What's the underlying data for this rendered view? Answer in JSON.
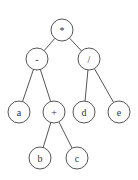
{
  "diagram": {
    "type": "expression-tree",
    "colors": {
      "stroke": "#555555",
      "label": "#333333",
      "background": "#ffffff"
    },
    "nodes": [
      {
        "id": "root",
        "label": "*",
        "x": 62,
        "y": 30,
        "r": 11
      },
      {
        "id": "minus",
        "label": "-",
        "x": 37,
        "y": 59,
        "r": 11
      },
      {
        "id": "div",
        "label": "/",
        "x": 89,
        "y": 59,
        "r": 11
      },
      {
        "id": "a",
        "label": "a",
        "x": 19,
        "y": 112,
        "r": 11
      },
      {
        "id": "plus",
        "label": "+",
        "x": 54,
        "y": 112,
        "r": 11
      },
      {
        "id": "d",
        "label": "d",
        "x": 84,
        "y": 112,
        "r": 11
      },
      {
        "id": "e",
        "label": "e",
        "x": 119,
        "y": 112,
        "r": 11
      },
      {
        "id": "b",
        "label": "b",
        "x": 40,
        "y": 158,
        "r": 11
      },
      {
        "id": "c",
        "label": "c",
        "x": 77,
        "y": 158,
        "r": 11
      }
    ],
    "edges": [
      [
        "root",
        "minus"
      ],
      [
        "root",
        "div"
      ],
      [
        "minus",
        "a"
      ],
      [
        "minus",
        "plus"
      ],
      [
        "div",
        "d"
      ],
      [
        "div",
        "e"
      ],
      [
        "plus",
        "b"
      ],
      [
        "plus",
        "c"
      ]
    ]
  }
}
